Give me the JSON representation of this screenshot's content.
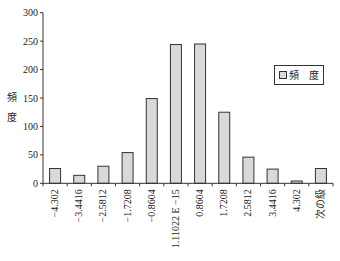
{
  "chart_data": {
    "type": "bar",
    "title": "",
    "xlabel": "",
    "ylabel": "頻度",
    "ylabel_chars": [
      "頻",
      "度"
    ],
    "ylim": [
      0,
      300
    ],
    "yticks": [
      0,
      50,
      100,
      150,
      200,
      250,
      300
    ],
    "grid": false,
    "legend_position": "right",
    "categories": [
      "−4.302",
      "−3.4416",
      "−2.5812",
      "−1.7208",
      "−0.8604",
      "1.11022 E −15",
      "0.8604",
      "1.7208",
      "2.5812",
      "3.4416",
      "4.302",
      "次の級"
    ],
    "series": [
      {
        "name": "頻　度",
        "values": [
          26,
          14,
          30,
          54,
          149,
          244,
          245,
          125,
          46,
          25,
          4,
          26
        ],
        "color": "#d9d9d9",
        "edge": "#333333"
      }
    ]
  }
}
